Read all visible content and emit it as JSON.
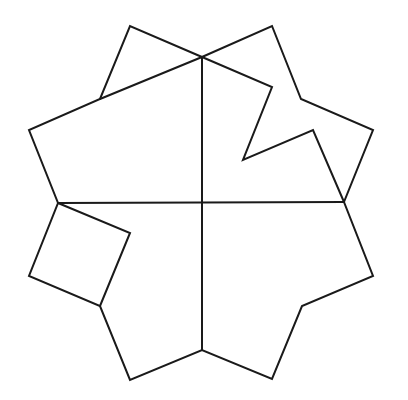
{
  "diagram": {
    "stroke_color": "#1a1a1a",
    "background": "#ffffff",
    "outline": [
      [
        202,
        57
      ],
      [
        130,
        26
      ],
      [
        100,
        99
      ],
      [
        29,
        130
      ],
      [
        58,
        203
      ],
      [
        29,
        276
      ],
      [
        100,
        306
      ],
      [
        130,
        380
      ],
      [
        202,
        350
      ],
      [
        272,
        379
      ],
      [
        302,
        306
      ],
      [
        373,
        276
      ],
      [
        344,
        202
      ],
      [
        373,
        130
      ],
      [
        301,
        99
      ],
      [
        272,
        26
      ],
      [
        202,
        57
      ]
    ],
    "cuts": [
      {
        "name": "vertical-cut",
        "points": [
          [
            202,
            57
          ],
          [
            202,
            350
          ]
        ]
      },
      {
        "name": "horizontal-cut",
        "points": [
          [
            58,
            203
          ],
          [
            344,
            202
          ]
        ]
      },
      {
        "name": "top-left-diagonal-cut",
        "points": [
          [
            100,
            99
          ],
          [
            202,
            57
          ]
        ]
      },
      {
        "name": "zigzag-cut",
        "points": [
          [
            202,
            57
          ],
          [
            272,
            87
          ],
          [
            243,
            160
          ],
          [
            313,
            130
          ],
          [
            344,
            202
          ]
        ]
      },
      {
        "name": "square-cut",
        "points": [
          [
            58,
            203
          ],
          [
            130,
            233
          ],
          [
            100,
            306
          ]
        ]
      }
    ]
  }
}
